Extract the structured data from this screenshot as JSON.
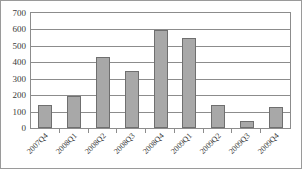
{
  "chart_data": {
    "type": "bar",
    "title": "",
    "subtitle": "",
    "xlabel": "",
    "ylabel": "",
    "categories": [
      "2007Q4",
      "2008Q1",
      "2008Q2",
      "2008Q3",
      "2008Q4",
      "2009Q1",
      "2009Q2",
      "2009Q3",
      "2009Q4"
    ],
    "values": [
      140,
      195,
      430,
      345,
      595,
      550,
      140,
      40,
      125
    ],
    "ylim": [
      0,
      700
    ],
    "ytick_labels": [
      "700",
      "600",
      "500",
      "400",
      "300",
      "200",
      "100",
      "0"
    ],
    "ytick_values": [
      700,
      600,
      500,
      400,
      300,
      200,
      100,
      0
    ],
    "ystep": 100,
    "grid": true,
    "legend": false,
    "legend_position": "none",
    "annotations": [],
    "colors": {
      "bar_fill": "#a8a8a8",
      "bar_border": "#6f6f6f",
      "gridline": "#8c8c8c",
      "axis": "#8c8c8c",
      "frame": "#9a9a9a",
      "text": "#3a3a3a",
      "background": "#ffffff"
    }
  }
}
